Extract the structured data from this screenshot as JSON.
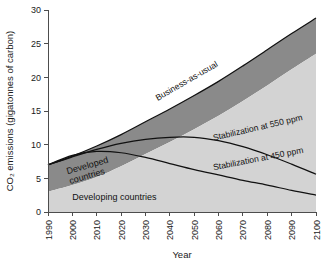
{
  "chart_data": {
    "type": "area",
    "title": "",
    "subtitle": "",
    "xlabel": "Year",
    "ylabel": "CO2 emissions (gigatonnes of carbon)",
    "ylabel_display": "CO₂ emissions (gigatonnes of carbon)",
    "xlim": [
      1990,
      2100
    ],
    "ylim": [
      0,
      30
    ],
    "grid": false,
    "legend_position": "inline-annotations",
    "x_ticks": [
      1990,
      2000,
      2010,
      2020,
      2030,
      2040,
      2050,
      2060,
      2070,
      2080,
      2090,
      2100
    ],
    "x_tick_labels": [
      "1990",
      "2000",
      "2010",
      "2020",
      "2030",
      "2040",
      "2050",
      "2060",
      "2070",
      "2080",
      "2090",
      "2100"
    ],
    "y_ticks": [
      0,
      5,
      10,
      15,
      20,
      25,
      30
    ],
    "y_tick_labels": [
      "0",
      "5",
      "10",
      "15",
      "20",
      "25",
      "30"
    ],
    "x": [
      1990,
      2000,
      2010,
      2020,
      2030,
      2040,
      2050,
      2060,
      2070,
      2080,
      2090,
      2100
    ],
    "series": [
      {
        "name": "Business-as-usual",
        "label": "Business-as-usual",
        "kind": "area-top",
        "description": "Total emissions under business-as-usual; upper bound of stacked area",
        "color": "#8a8a8a",
        "values": [
          7.0,
          8.3,
          9.8,
          11.5,
          13.4,
          15.3,
          17.3,
          19.4,
          21.7,
          24.1,
          26.5,
          28.8
        ]
      },
      {
        "name": "Developing countries",
        "label": "Developing countries",
        "kind": "area-band",
        "description": "Lower light-grey band: emissions from developing countries",
        "color": "#d3d3d3",
        "values": [
          3.0,
          4.0,
          5.2,
          6.8,
          8.6,
          10.4,
          12.3,
          14.3,
          16.5,
          18.8,
          21.2,
          23.5
        ]
      },
      {
        "name": "Developed countries",
        "label": "Developed countries",
        "kind": "area-band",
        "description": "Upper dark-grey band: emissions from developed countries (difference between total and developing)",
        "color": "#8a8a8a",
        "values": [
          4.0,
          4.3,
          4.6,
          4.7,
          4.8,
          4.9,
          5.0,
          5.1,
          5.2,
          5.3,
          5.3,
          5.3
        ]
      },
      {
        "name": "Stabilization at 550 ppm",
        "label": "Stabilization at 550 ppm",
        "kind": "line",
        "color": "#111111",
        "values": [
          7.0,
          8.2,
          9.3,
          10.2,
          10.8,
          11.1,
          11.1,
          10.6,
          9.7,
          8.5,
          7.1,
          5.6
        ]
      },
      {
        "name": "Stabilization at 450 ppm",
        "label": "Stabilization at 450 ppm",
        "kind": "line",
        "color": "#111111",
        "values": [
          7.0,
          8.4,
          9.0,
          8.8,
          8.1,
          7.2,
          6.3,
          5.5,
          4.7,
          4.0,
          3.2,
          2.5
        ]
      }
    ],
    "annotations": [
      {
        "text": "Business-as-usual",
        "x": 2035,
        "y": 16.5,
        "rotation": -30
      },
      {
        "text": "Stabilization at 550 ppm",
        "x": 2058,
        "y": 10.6,
        "rotation": -13
      },
      {
        "text": "Stabilization at 450 ppm",
        "x": 2058,
        "y": 6.2,
        "rotation": -11
      },
      {
        "text": "Developed countries",
        "x": 1998,
        "y": 5.6,
        "rotation": -16
      },
      {
        "text": "Developing countries",
        "x": 2000,
        "y": 1.8,
        "rotation": 0
      }
    ]
  },
  "axes": {
    "x_title": "Year",
    "y_title": "CO₂ emissions (gigatonnes of carbon)"
  },
  "colors": {
    "developed_band": "#8a8a8a",
    "developing_band": "#d3d3d3",
    "curve_line": "#111111",
    "axis": "#4d4d4d",
    "background": "#ffffff"
  }
}
